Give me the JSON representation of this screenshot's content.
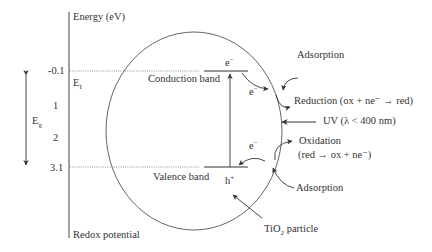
{
  "axis": {
    "top_label": "Energy (eV)",
    "bottom_label": "Redox potential",
    "ticks": [
      "-0.1",
      "1",
      "2",
      "3.1"
    ],
    "fermi_label": "E",
    "fermi_sub": "f",
    "gap_label": "E",
    "gap_sub": "g"
  },
  "particle": {
    "conduction_band": "Conduction band",
    "valence_band": "Valence band",
    "electron_top": "e",
    "electron_mid": "e",
    "electron_low": "e",
    "minus": "−",
    "hole": "h",
    "plus": "+",
    "name_prefix": "TiO",
    "name_sub": "2",
    "name_suffix": " particle"
  },
  "annotations": {
    "adsorption_top": "Adsorption",
    "reduction": "Reduction (ox + ne⁻ → red)",
    "uv": "UV (λ < 400 nm)",
    "oxidation": "Oxidation",
    "oxidation_eq": "(red → ox + ne⁻)",
    "adsorption_bottom": "Adsorption"
  }
}
